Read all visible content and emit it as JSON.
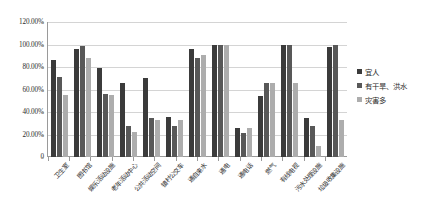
{
  "legend": {
    "position": "right",
    "entries": [
      {
        "label": "宜人",
        "color": "#3b3b3b"
      },
      {
        "label": "有干旱、洪水",
        "color": "#585858"
      },
      {
        "label": "灾害多",
        "color": "#adadad"
      }
    ]
  },
  "yaxis": {
    "ticks": [
      "0",
      "20.00%",
      "40.00%",
      "60.00%",
      "80.00%",
      "100.00%",
      "120.00%"
    ],
    "min": 0,
    "max": 120
  },
  "chart_data": {
    "type": "bar",
    "title": "",
    "xlabel": "",
    "ylabel": "",
    "ylim": [
      0,
      120
    ],
    "ytick_values": [
      0,
      20,
      40,
      60,
      80,
      100,
      120
    ],
    "ytick_labels": [
      "0",
      "20.00%",
      "40.00%",
      "60.00%",
      "80.00%",
      "100.00%",
      "120.00%"
    ],
    "grid": true,
    "legend_position": "right",
    "categories": [
      "卫生室",
      "图书馆",
      "娱乐活动设施",
      "老年活动中心",
      "公共活动空间",
      "镇村公交车",
      "通自来水",
      "通电",
      "通电话",
      "燃气",
      "有线电视",
      "污水处理设施",
      "垃圾收集设施"
    ],
    "series": [
      {
        "name": "宜人",
        "color": "#3b3b3b",
        "values": [
          86,
          96,
          79,
          66,
          70,
          36,
          96,
          100,
          26,
          54,
          100,
          35,
          98
        ]
      },
      {
        "name": "有干旱、洪水",
        "color": "#585858",
        "values": [
          71,
          99,
          56,
          28,
          35,
          28,
          88,
          100,
          21,
          66,
          100,
          28,
          100
        ]
      },
      {
        "name": "灾害多",
        "color": "#adadad",
        "values": [
          55,
          88,
          55,
          22,
          33,
          33,
          91,
          100,
          26,
          66,
          66,
          10,
          33
        ]
      }
    ]
  }
}
